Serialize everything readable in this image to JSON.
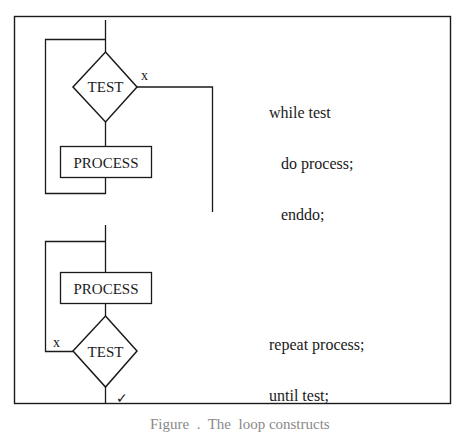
{
  "diagram": {
    "while_loop": {
      "test_label": "TEST",
      "process_label": "PROCESS",
      "exit_label": "x",
      "code_lines": [
        "while test",
        "   do process;",
        "   enddo;"
      ]
    },
    "repeat_loop": {
      "process_label": "PROCESS",
      "test_label": "TEST",
      "loop_label": "x",
      "exit_mark": "✓",
      "code_lines": [
        "repeat process;",
        "until test;"
      ]
    },
    "caption": "Figure  .  The  loop constructs"
  }
}
